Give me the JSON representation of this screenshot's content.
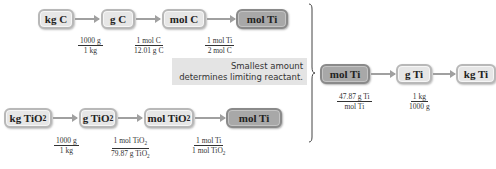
{
  "top_row": {
    "boxes": [
      "kg C",
      "g C",
      "mol C",
      "mol Ti"
    ],
    "fractions": [
      {
        "num": "1000 g",
        "den": "1 kg"
      },
      {
        "num": "1 mol C",
        "den": "12.01 g C"
      },
      {
        "num": "1 mol Ti",
        "den": "2 mol C"
      }
    ]
  },
  "bottom_row": {
    "boxes": [
      "kg TiO",
      "g TiO",
      "mol TiO",
      "mol Ti"
    ],
    "box_subscripts": [
      "2",
      "2",
      "2",
      ""
    ],
    "fractions": [
      {
        "num": "1000 g",
        "den": "1 kg"
      },
      {
        "num_main": "1 mol TiO",
        "num_sub": "2",
        "den_main": "79.87 g TiO",
        "den_sub": "2"
      },
      {
        "num": "1 mol Ti",
        "den_main": "1 mol TiO",
        "den_sub": "2"
      }
    ]
  },
  "note": {
    "line1": "Smallest amount",
    "line2": "determines limiting reactant."
  },
  "right_row": {
    "boxes": [
      "mol Ti",
      "g Ti",
      "kg Ti"
    ],
    "fractions": [
      {
        "num": "47.87 g Ti",
        "den": "mol Ti"
      },
      {
        "num": "1 kg",
        "den": "1000 g"
      }
    ]
  }
}
